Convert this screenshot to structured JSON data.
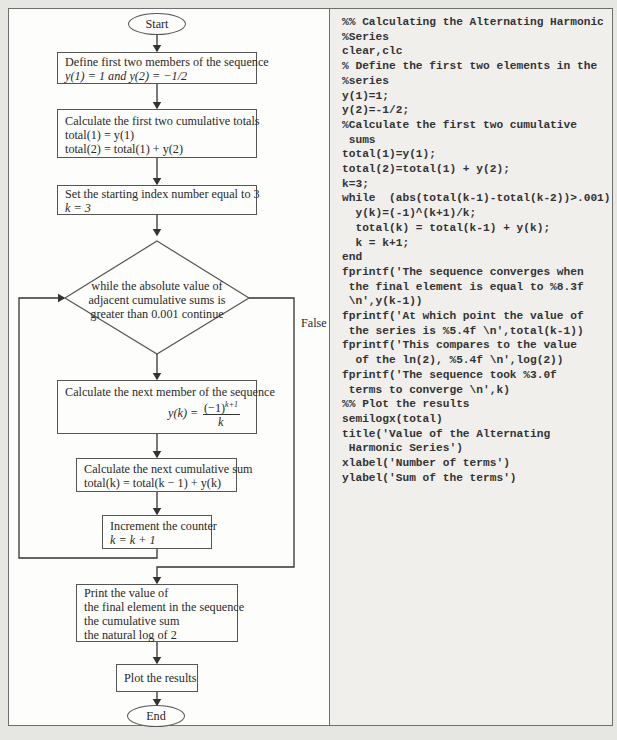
{
  "flowchart": {
    "start": "Start",
    "end": "End",
    "steps": [
      {
        "lines": [
          "Define first two members of the sequence",
          "y(1) = 1 and y(2) = −1/2"
        ]
      },
      {
        "lines": [
          "Calculate the first two cumulative totals",
          "total(1) = y(1)",
          "total(2) = total(1) + y(2)"
        ]
      },
      {
        "lines": [
          "Set the starting index number equal to 3",
          "k = 3"
        ]
      },
      {
        "lines": [
          "Calculate the next member of the sequence"
        ],
        "formula_lhs": "y(k) =",
        "formula_num": "(−1)",
        "formula_exp": "k+1",
        "formula_den": "k"
      },
      {
        "lines": [
          "Calculate the next cumulative sum",
          "total(k) = total(k − 1) + y(k)"
        ]
      },
      {
        "lines": [
          "Increment the counter",
          "k = k + 1"
        ]
      },
      {
        "lines": [
          "Print the value of",
          "the final element in the sequence",
          "the cumulative sum",
          "the natural log of 2"
        ]
      },
      {
        "lines": [
          "Plot the results"
        ]
      }
    ],
    "decision": {
      "lines": [
        "while the absolute value of",
        "adjacent cumulative sums is",
        "greater than 0.001 continue"
      ],
      "false_label": "False"
    }
  },
  "code": {
    "lines": [
      "%% Calculating the Alternating Harmonic",
      "%Series",
      "clear,clc",
      "% Define the first two elements in the",
      "%series",
      "y(1)=1;",
      "y(2)=-1/2;",
      "%Calculate the first two cumulative",
      " sums",
      "total(1)=y(1);",
      "total(2)=total(1) + y(2);",
      "k=3;",
      "while  (abs(total(k-1)-total(k-2))>.001)",
      "  y(k)=(-1)^(k+1)/k;",
      "  total(k) = total(k-1) + y(k);",
      "  k = k+1;",
      "end",
      "fprintf('The sequence converges when",
      " the final element is equal to %8.3f",
      " \\n',y(k-1))",
      "fprintf('At which point the value of",
      " the series is %5.4f \\n',total(k-1))",
      "fprintf('This compares to the value",
      "  of the ln(2), %5.4f \\n',log(2))",
      "fprintf('The sequence took %3.0f",
      " terms to converge \\n',k)",
      "%% Plot the results",
      "semilogx(total)",
      "title('Value of the Alternating",
      " Harmonic Series')",
      "xlabel('Number of terms')",
      "ylabel('Sum of the terms')"
    ]
  }
}
